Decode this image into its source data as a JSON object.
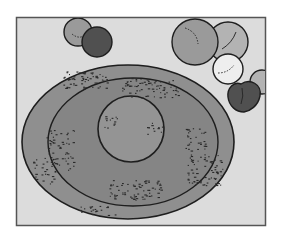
{
  "figure": {
    "colors": {
      "page": "#ffffff",
      "frame_fill": "#dcdcdc",
      "frame_border": "#555555",
      "outer_ring": "#8f8f8f",
      "middle_ring": "#858585",
      "center_disc": "#949494",
      "outline": "#1e1e1e",
      "speckle": "#2a2a2a",
      "sphere_gray": "#9a9a9a",
      "sphere_light": "#b3b3b3",
      "sphere_white": "#eeeeee",
      "sphere_dark": "#505050"
    },
    "spheres": [
      {
        "name": "small-gray-sphere",
        "tone": "gray"
      },
      {
        "name": "dark-sphere",
        "tone": "dark"
      },
      {
        "name": "large-gray-sphere",
        "tone": "gray"
      },
      {
        "name": "light-gray-sphere",
        "tone": "light"
      },
      {
        "name": "white-sphere",
        "tone": "white"
      },
      {
        "name": "dark-heart-shape",
        "tone": "dark"
      },
      {
        "name": "edge-partial-sphere",
        "tone": "light"
      }
    ]
  }
}
